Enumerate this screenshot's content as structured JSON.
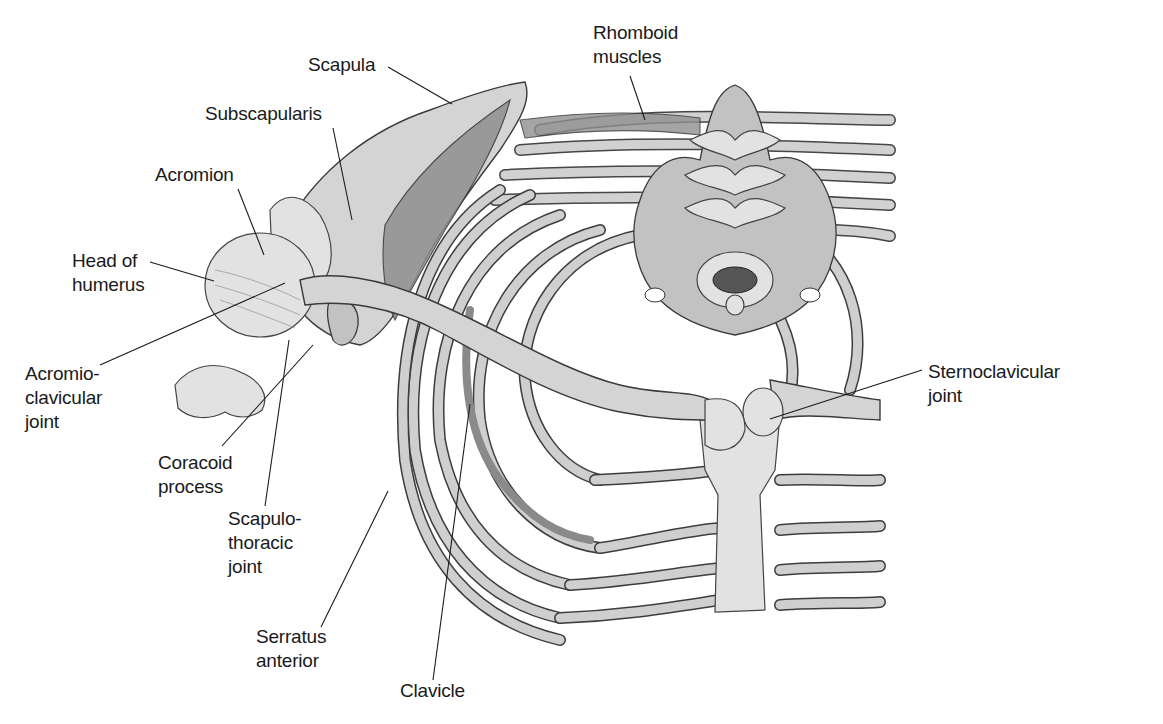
{
  "figure": {
    "background": "#ffffff",
    "text_color": "#1a1a1a",
    "labels": [
      {
        "id": "scapula",
        "text": "Scapula",
        "x": 343,
        "y": 54
      },
      {
        "id": "subscapularis",
        "text": "Subscapularis",
        "x": 205,
        "y": 104
      },
      {
        "id": "acromion",
        "text": "Acromion",
        "x": 155,
        "y": 164
      },
      {
        "id": "head_of_humerus",
        "text": "Head of\nhumerus",
        "x": 72,
        "y": 250
      },
      {
        "id": "acromioclavicular_joint",
        "text": "Acromio-\nclavicular\njoint",
        "x": 25,
        "y": 364
      },
      {
        "id": "coracoid_process",
        "text": "Coracoid\nprocess",
        "x": 158,
        "y": 452
      },
      {
        "id": "scapulothoracic_joint",
        "text": "Scapulo-\nthoracic\njoint",
        "x": 228,
        "y": 506
      },
      {
        "id": "serratus_anterior",
        "text": "Serratus\nanterior",
        "x": 256,
        "y": 625
      },
      {
        "id": "clavicle",
        "text": "Clavicle",
        "x": 400,
        "y": 680
      },
      {
        "id": "rhomboid_muscles",
        "text": "Rhomboid\nmuscles",
        "x": 593,
        "y": 22
      },
      {
        "id": "sternoclavicular_joint",
        "text": "Sternoclavicular\njoint",
        "x": 928,
        "y": 362
      }
    ]
  }
}
